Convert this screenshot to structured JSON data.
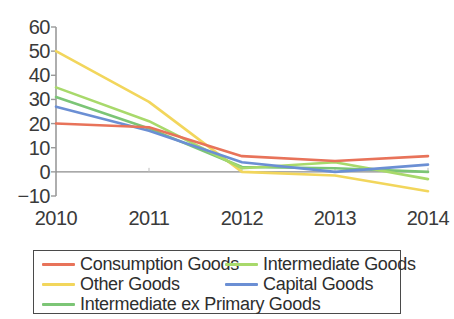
{
  "chart_data": {
    "type": "line",
    "title": "",
    "xlabel": "",
    "ylabel": "",
    "x": [
      2010,
      2011,
      2012,
      2013,
      2014
    ],
    "xtick_labels": [
      "2010",
      "2011",
      "2012",
      "2013",
      "2014"
    ],
    "ytick_labels": [
      "60",
      "50",
      "40",
      "30",
      "20",
      "10",
      "0",
      "−10"
    ],
    "ytick_values": [
      60,
      50,
      40,
      30,
      20,
      10,
      0,
      -10
    ],
    "ylim": [
      -10,
      60
    ],
    "xlim": [
      2010,
      2014
    ],
    "grid": false,
    "zero_line": true,
    "legend_position": "below",
    "legend_columns": 2,
    "series": [
      {
        "name": "Consumption Goods",
        "color": "#e8735a",
        "values": [
          20,
          18.5,
          6.5,
          4.5,
          6.5
        ]
      },
      {
        "name": "Other Goods",
        "color": "#f2d65c",
        "values": [
          50,
          29,
          0,
          -1.5,
          -8
        ]
      },
      {
        "name": "Intermediate ex Primary Goods",
        "color": "#7cc576",
        "values": [
          31,
          18,
          2,
          1.5,
          0
        ]
      },
      {
        "name": "Intermediate Goods",
        "color": "#a8d96b",
        "values": [
          35,
          21,
          1.5,
          4,
          -3
        ]
      },
      {
        "name": "Capital Goods",
        "color": "#6b8fd4",
        "values": [
          27,
          17,
          4,
          0,
          3
        ]
      }
    ]
  },
  "axes": {
    "axis_color": "#9a9a9a",
    "zero_line_color": "#8c8c8c",
    "tick_text_color": "#3a3a3a"
  },
  "legend": {
    "border_color": "#4a4a4a",
    "entries": [
      {
        "label": "Consumption Goods",
        "color": "#e8735a",
        "col": 0,
        "row": 0
      },
      {
        "label": "Other Goods",
        "color": "#f2d65c",
        "col": 0,
        "row": 1
      },
      {
        "label": "Intermediate ex Primary Goods",
        "color": "#7cc576",
        "col": 0,
        "row": 2
      },
      {
        "label": "Intermediate Goods",
        "color": "#a8d96b",
        "col": 1,
        "row": 0
      },
      {
        "label": "Capital Goods",
        "color": "#6b8fd4",
        "col": 1,
        "row": 1
      }
    ]
  },
  "title_remnant": ""
}
